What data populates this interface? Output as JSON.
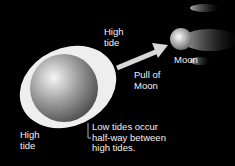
{
  "diagram": {
    "labels": {
      "high_tide_top": "High\ntide",
      "high_tide_bottom": "High\ntide",
      "pull_of_moon": "Pull of\nMoon",
      "moon": "Moon",
      "low_tides": "Low tides occur\nhalf-way between\nhigh tides."
    },
    "colors": {
      "background": "#000000",
      "tidal_bulge": "#f0f0f0",
      "earth": "#9a9a9a",
      "arrow": "#d8d8d8"
    }
  }
}
